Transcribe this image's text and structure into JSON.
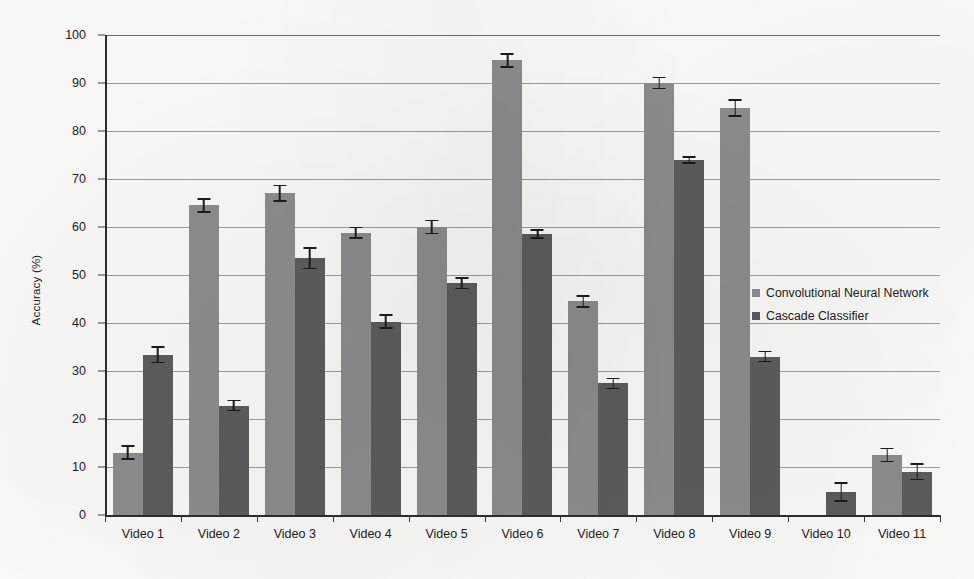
{
  "chart_data": {
    "type": "bar",
    "title": "",
    "xlabel": "",
    "ylabel": "Accuracy (%)",
    "ylim": [
      0,
      100
    ],
    "ytick_step": 10,
    "yticks": [
      0,
      10,
      20,
      30,
      40,
      50,
      60,
      70,
      80,
      90,
      100
    ],
    "grid": true,
    "legend_position": "right-middle",
    "categories": [
      "Video 1",
      "Video 2",
      "Video 3",
      "Video 4",
      "Video 5",
      "Video 6",
      "Video 7",
      "Video 8",
      "Video 9",
      "Video 10",
      "Video 11"
    ],
    "series": [
      {
        "name": "Convolutional Neural Network",
        "color": "#8e8e8e",
        "values": [
          13.0,
          64.5,
          67.0,
          58.8,
          60.0,
          94.7,
          44.5,
          90.0,
          84.8,
          0.0,
          12.5
        ],
        "errors": [
          1.5,
          1.5,
          1.8,
          1.3,
          1.5,
          1.5,
          1.3,
          1.3,
          1.8,
          0.0,
          1.5
        ]
      },
      {
        "name": "Cascade Classifier",
        "color": "#5d5d5d",
        "values": [
          33.4,
          22.8,
          53.5,
          40.3,
          48.3,
          58.5,
          27.4,
          74.0,
          33.0,
          4.8,
          9.0
        ],
        "errors": [
          1.8,
          1.2,
          2.3,
          1.5,
          1.3,
          1.0,
          1.2,
          0.8,
          1.2,
          2.0,
          1.8
        ]
      }
    ]
  },
  "legend": {
    "items": [
      {
        "label": "Convolutional Neural Network",
        "color": "#8e8e8e"
      },
      {
        "label": "Cascade Classifier",
        "color": "#5d5d5d"
      }
    ]
  }
}
